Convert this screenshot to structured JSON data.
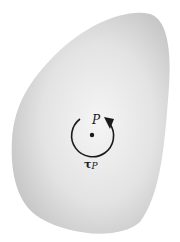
{
  "diagram": {
    "body": {
      "fill_center": "#f4f4f4",
      "fill_edge": "#c9c9c9"
    },
    "point": {
      "label": "P"
    },
    "torque": {
      "symbol": "τ",
      "subscript": "P",
      "direction": "counterclockwise",
      "color": "#1a1a1a"
    }
  }
}
